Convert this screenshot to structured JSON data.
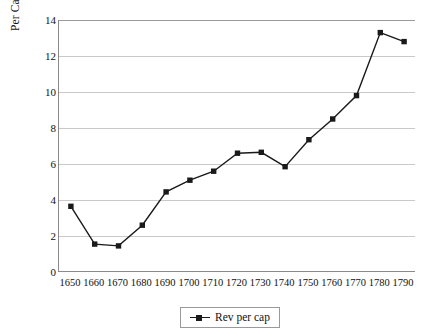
{
  "chart_data": {
    "type": "line",
    "title": "",
    "xlabel": "",
    "ylabel": "Per Capita Revenues (in grams of gold)",
    "categories": [
      "1650",
      "1660",
      "1670",
      "1680",
      "1690",
      "1700",
      "1710",
      "1720",
      "1730",
      "1740",
      "1750",
      "1760",
      "1770",
      "1780",
      "1790"
    ],
    "series": [
      {
        "name": "Rev per cap",
        "values": [
          3.65,
          1.55,
          1.45,
          2.6,
          4.45,
          5.1,
          5.6,
          6.6,
          6.65,
          5.85,
          7.35,
          8.5,
          9.8,
          13.3,
          12.8
        ],
        "color": "#1a1a1a",
        "marker": "square"
      }
    ],
    "ylim": [
      0,
      14
    ],
    "yticks": [
      0,
      2,
      4,
      6,
      8,
      10,
      12,
      14
    ],
    "ytick_labels": [
      "0",
      "2",
      "4",
      "6",
      "8",
      "10",
      "12",
      "14"
    ],
    "grid": "horizontal",
    "grid_color": "#c9c9c9",
    "legend_position": "bottom-center",
    "legend_entries": [
      "Rev per cap"
    ]
  },
  "legend": {
    "label": "Rev per cap",
    "marker_name": "legend-square-marker"
  },
  "axes": {
    "y_title": "Per Capita Revenues (in grams of gold)",
    "axis_color": "#8a8a8a"
  }
}
